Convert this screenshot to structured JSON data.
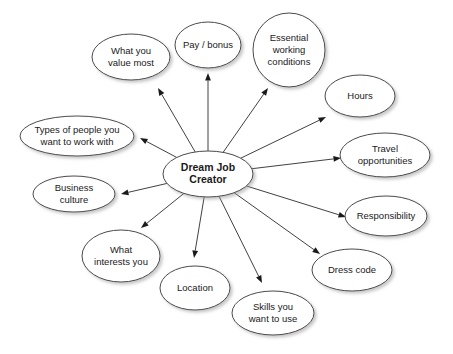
{
  "diagram": {
    "type": "mind-map",
    "background_color": "#ffffff",
    "node_fill": "#ffffff",
    "node_stroke": "#4a4a4a",
    "edge_color": "#2b2b2b",
    "text_color": "#1a1a1a",
    "central_node": {
      "id": "dream-job-creator",
      "lines": [
        "Dream Job",
        "Creator"
      ],
      "cx": 208,
      "cy": 174,
      "rx": 45,
      "ry": 23,
      "bold": true,
      "font_size": 10.5
    },
    "branches": [
      {
        "id": "what-you-value-most",
        "lines": [
          "What you",
          "value most"
        ],
        "cx": 131,
        "cy": 57,
        "rx": 39,
        "ry": 23,
        "font_size": 9.5,
        "arrow_to": {
          "x": 158,
          "y": 88
        }
      },
      {
        "id": "pay-bonus",
        "lines": [
          "Pay / bonus"
        ],
        "cx": 208,
        "cy": 45,
        "rx": 33,
        "ry": 23,
        "font_size": 9.5,
        "arrow_to": {
          "x": 208,
          "y": 73
        }
      },
      {
        "id": "essential-working-conditions",
        "lines": [
          "Essential",
          "working",
          "conditions"
        ],
        "cx": 289,
        "cy": 50,
        "rx": 36,
        "ry": 37,
        "font_size": 9.5,
        "arrow_to": {
          "x": 268,
          "y": 88
        }
      },
      {
        "id": "hours",
        "lines": [
          "Hours"
        ],
        "cx": 360,
        "cy": 96,
        "rx": 35,
        "ry": 21,
        "font_size": 9.5,
        "arrow_to": {
          "x": 326,
          "y": 117
        }
      },
      {
        "id": "travel-opportunities",
        "lines": [
          "Travel",
          "opportunities"
        ],
        "cx": 385,
        "cy": 155,
        "rx": 45,
        "ry": 22,
        "font_size": 9.5,
        "arrow_to": {
          "x": 341,
          "y": 158
        }
      },
      {
        "id": "responsibility",
        "lines": [
          "Responsibility"
        ],
        "cx": 386,
        "cy": 216,
        "rx": 41,
        "ry": 20,
        "font_size": 9.5,
        "arrow_to": {
          "x": 346,
          "y": 217
        }
      },
      {
        "id": "dress-code",
        "lines": [
          "Dress code"
        ],
        "cx": 352,
        "cy": 270,
        "rx": 40,
        "ry": 21,
        "font_size": 9.5,
        "arrow_to": {
          "x": 320,
          "y": 254
        }
      },
      {
        "id": "skills-you-want-to-use",
        "lines": [
          "Skills you",
          "want to use"
        ],
        "cx": 273,
        "cy": 313,
        "rx": 41,
        "ry": 22,
        "font_size": 9.5,
        "arrow_to": {
          "x": 262,
          "y": 283
        }
      },
      {
        "id": "location",
        "lines": [
          "Location"
        ],
        "cx": 195,
        "cy": 288,
        "rx": 35,
        "ry": 22,
        "font_size": 9.5,
        "arrow_to": {
          "x": 194,
          "y": 258
        }
      },
      {
        "id": "what-interests-you",
        "lines": [
          "What",
          "interests you"
        ],
        "cx": 121,
        "cy": 256,
        "rx": 39,
        "ry": 26,
        "font_size": 9.5,
        "arrow_to": {
          "x": 141,
          "y": 228
        }
      },
      {
        "id": "business-culture",
        "lines": [
          "Business",
          "culture"
        ],
        "cx": 74,
        "cy": 194,
        "rx": 41,
        "ry": 18,
        "font_size": 9.5,
        "arrow_to": {
          "x": 121,
          "y": 194
        }
      },
      {
        "id": "types-of-people-you-want-to-work-with",
        "lines": [
          "Types of people you",
          "want to work with"
        ],
        "cx": 77,
        "cy": 136,
        "rx": 57,
        "ry": 20,
        "font_size": 9.5,
        "arrow_to": {
          "x": 140,
          "y": 138
        }
      }
    ]
  }
}
